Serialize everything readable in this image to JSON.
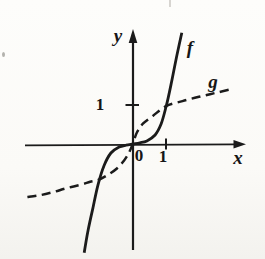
{
  "figure": {
    "background": "#fbfaf7",
    "ink": "#1b1b1b"
  },
  "chart_data": {
    "type": "line",
    "title": "",
    "xlabel": "x",
    "ylabel": "y",
    "origin_label": "0",
    "grid": false,
    "xlim": [
      -3.3,
      3.4
    ],
    "ylim": [
      -2.9,
      2.95
    ],
    "x_ticks": [
      {
        "value": 1,
        "label": "1"
      }
    ],
    "y_ticks": [
      {
        "value": 1,
        "label": "1"
      }
    ],
    "legend": "curve labels drawn beside curves",
    "series": [
      {
        "name": "f",
        "style": "solid",
        "points": [
          [
            -1.48,
            -2.79
          ],
          [
            -1.36,
            -2.21
          ],
          [
            -1.21,
            -1.62
          ],
          [
            -1.06,
            -1.05
          ],
          [
            -0.88,
            -0.56
          ],
          [
            -0.67,
            -0.23
          ],
          [
            -0.42,
            -0.08
          ],
          [
            -0.21,
            -0.03
          ],
          [
            0,
            0
          ],
          [
            0.21,
            0.03
          ],
          [
            0.42,
            0.08
          ],
          [
            0.67,
            0.23
          ],
          [
            0.85,
            0.51
          ],
          [
            1.0,
            0.95
          ],
          [
            1.15,
            1.51
          ],
          [
            1.3,
            2.15
          ],
          [
            1.48,
            2.85
          ]
        ]
      },
      {
        "name": "g",
        "style": "dashed",
        "points": [
          [
            -3.2,
            -1.36
          ],
          [
            -2.8,
            -1.31
          ],
          [
            -2.4,
            -1.23
          ],
          [
            -2.0,
            -1.13
          ],
          [
            -1.6,
            -1.05
          ],
          [
            -1.3,
            -0.97
          ],
          [
            -1.05,
            -0.92
          ],
          [
            -0.78,
            -0.8
          ],
          [
            -0.48,
            -0.62
          ],
          [
            -0.27,
            -0.42
          ],
          [
            -0.12,
            -0.22
          ],
          [
            0,
            0.02
          ],
          [
            0.12,
            0.3
          ],
          [
            0.3,
            0.52
          ],
          [
            0.6,
            0.72
          ],
          [
            1.0,
            0.97
          ],
          [
            1.5,
            1.1
          ],
          [
            2.0,
            1.21
          ],
          [
            2.5,
            1.31
          ],
          [
            3.0,
            1.41
          ]
        ]
      }
    ]
  }
}
